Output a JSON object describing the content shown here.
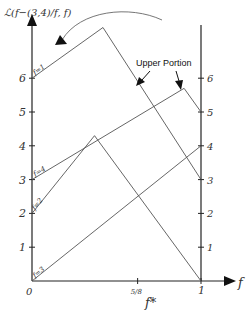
{
  "diagram": {
    "y_axis_label": "ℒ(f−(3,4)/f, f)",
    "x_axis_label": "f",
    "x_star_label": "f*",
    "origin_label": "0",
    "x_ticks": [
      {
        "value": 0.625,
        "label": "5/8"
      },
      {
        "value": 1,
        "label": "1"
      }
    ],
    "left_y_ticks": [
      "1",
      "2",
      "3",
      "4",
      "5",
      "6"
    ],
    "right_y_ticks": [
      "1",
      "2",
      "3",
      "4",
      "5",
      "6"
    ],
    "annotation": "Upper Portion",
    "curves": [
      {
        "label": "f=1",
        "start": 6,
        "peak_f": 0.42,
        "peak_value": 7.5,
        "end": 3
      },
      {
        "label": "f=4",
        "start": 3,
        "peak_f": 0.9,
        "peak_value": 5.7,
        "end": 5
      },
      {
        "label": "f=2",
        "start": 2,
        "peak_f": 0.37,
        "peak_value": 4.3,
        "end": 0
      },
      {
        "label": "f=3",
        "start": 0,
        "peak_f": 1,
        "peak_value": 4,
        "end": 4
      }
    ]
  }
}
